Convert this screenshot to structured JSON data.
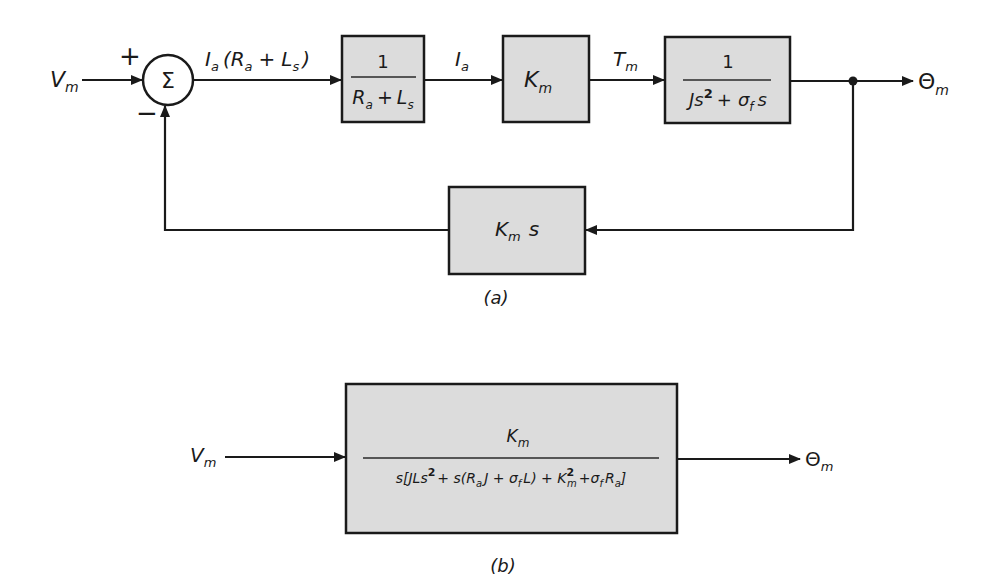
{
  "diagram_a": {
    "caption": "(a)",
    "input": {
      "sym": "V",
      "sub": "m"
    },
    "summing_junction": {
      "symbol": "Σ",
      "plus_sign": "+",
      "minus_sign": "−"
    },
    "signal_after_sum": {
      "main": "I",
      "sub1": "a",
      "mid": "(R",
      "sub2": "a",
      "plus": "+",
      "L": "L",
      "sub3": "s",
      "close": ")"
    },
    "block1": {
      "num": "1",
      "den_R": "R",
      "den_R_sub": "a",
      "den_plus": "+",
      "den_L": "L",
      "den_L_sub": "s"
    },
    "signal_ia": {
      "sym": "I",
      "sub": "a"
    },
    "block2": {
      "sym": "K",
      "sub": "m"
    },
    "signal_tm": {
      "sym": "T",
      "sub": "m"
    },
    "block3": {
      "num": "1",
      "den_J": "Js",
      "den_exp": "2",
      "den_plus": "+",
      "den_sigma": "σ",
      "den_sigma_sub": "f",
      "den_s": "s"
    },
    "output": {
      "sym": "Θ",
      "sub": "m"
    },
    "feedback_block": {
      "sym": "K",
      "sub": "m",
      "s": "s"
    }
  },
  "diagram_b": {
    "caption": "(b)",
    "input": {
      "sym": "V",
      "sub": "m"
    },
    "block": {
      "num": {
        "sym": "K",
        "sub": "m"
      },
      "den": {
        "p1": "s[JLs",
        "exp1": "2",
        "p2": "+ s(R",
        "sub_a": "a",
        "p3": "J + σ",
        "sub_f": "f",
        "p4": "L) + K",
        "sup2": "2",
        "sub_m": "m",
        "p5": "+σ",
        "sub_f2": "f",
        "p6": "R",
        "sub_a2": "a",
        "p7": "]"
      }
    },
    "output": {
      "sym": "Θ",
      "sub": "m"
    }
  },
  "colors": {
    "line": "#1a1a1a",
    "block_fill": "#dcdcdc",
    "background": "#ffffff"
  }
}
